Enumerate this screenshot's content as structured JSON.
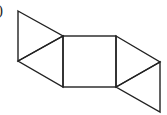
{
  "label": ")",
  "figure": {
    "stroke_color": "#222222",
    "square": {
      "x1": 63,
      "y1": 36,
      "x2": 116,
      "y2": 87
    },
    "triangles": [
      {
        "points": "18,11 63,36 18,61"
      },
      {
        "points": "18,61 63,36 63,87"
      },
      {
        "points": "116,36 160,62 116,87"
      },
      {
        "points": "116,87 160,62 160,112"
      }
    ]
  }
}
